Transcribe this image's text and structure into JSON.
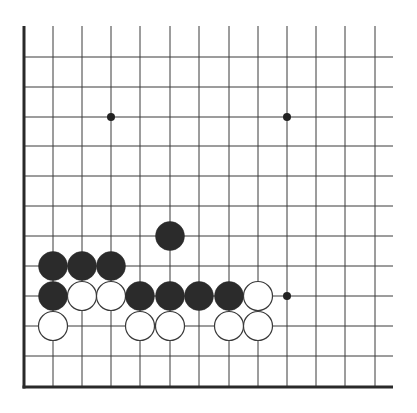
{
  "diagram": {
    "type": "go-board-fragment",
    "corner": "bottom-left",
    "colors": {
      "background": "#ffffff",
      "line": "#3a3a3a",
      "edge": "#2a2a2a",
      "black_stone": "#2b2b2b",
      "white_stone_fill": "#ffffff",
      "white_stone_stroke": "#3a3a3a",
      "star_point": "#222222"
    },
    "grid": {
      "columns_x": [
        24,
        53,
        82,
        111,
        140,
        170,
        199,
        229,
        258,
        287,
        316,
        345,
        375
      ],
      "rows_y": [
        57,
        87,
        117,
        146,
        176,
        206,
        236,
        266,
        296,
        326,
        356,
        386
      ],
      "top_extent_y": 26,
      "right_extent_x": 393,
      "left_edge_x": 24,
      "bottom_edge_y": 387
    },
    "star_points": [
      {
        "col": 3,
        "row": 2
      },
      {
        "col": 9,
        "row": 2
      },
      {
        "col": 9,
        "row": 8
      }
    ],
    "stones": [
      {
        "color": "black",
        "col": 5,
        "row": 6
      },
      {
        "color": "black",
        "col": 1,
        "row": 7
      },
      {
        "color": "black",
        "col": 2,
        "row": 7
      },
      {
        "color": "black",
        "col": 3,
        "row": 7
      },
      {
        "color": "black",
        "col": 1,
        "row": 8
      },
      {
        "color": "white",
        "col": 2,
        "row": 8
      },
      {
        "color": "white",
        "col": 3,
        "row": 8
      },
      {
        "color": "black",
        "col": 4,
        "row": 8
      },
      {
        "color": "black",
        "col": 5,
        "row": 8
      },
      {
        "color": "black",
        "col": 6,
        "row": 8
      },
      {
        "color": "black",
        "col": 7,
        "row": 8
      },
      {
        "color": "white",
        "col": 8,
        "row": 8
      },
      {
        "color": "white",
        "col": 1,
        "row": 9
      },
      {
        "color": "white",
        "col": 4,
        "row": 9
      },
      {
        "color": "white",
        "col": 5,
        "row": 9
      },
      {
        "color": "white",
        "col": 7,
        "row": 9
      },
      {
        "color": "white",
        "col": 8,
        "row": 9
      }
    ],
    "stone_radius": 14.5,
    "star_radius": 4
  }
}
